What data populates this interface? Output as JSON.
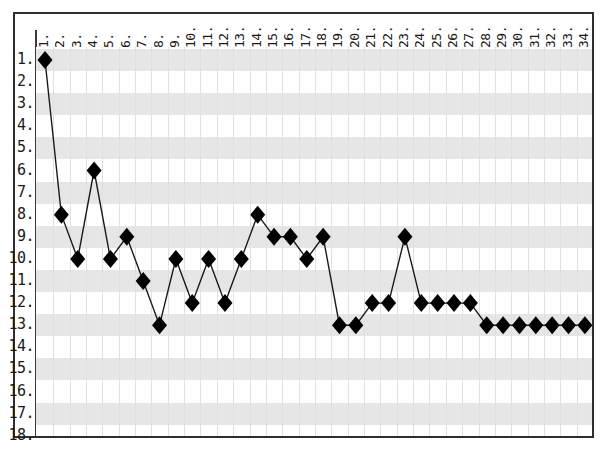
{
  "chart": {
    "type": "line",
    "background": "#ffffff",
    "band_color": "#e6e6e6",
    "grid_color": "#e0e0e0",
    "marker_color": "#000000",
    "line_color": "#1a1a1a",
    "border_color": "#2e2e2e"
  },
  "axes": {
    "x_ticks": [
      "1.",
      "2.",
      "3.",
      "4.",
      "5.",
      "6.",
      "7.",
      "8.",
      "9.",
      "10.",
      "11.",
      "12.",
      "13.",
      "14.",
      "15.",
      "16.",
      "17.",
      "18.",
      "19.",
      "20.",
      "21.",
      "22.",
      "23.",
      "24.",
      "25.",
      "26.",
      "27.",
      "28.",
      "29.",
      "30.",
      "31.",
      "32.",
      "33.",
      "34."
    ],
    "y_ticks": [
      "1.",
      "2.",
      "3.",
      "4.",
      "5.",
      "6.",
      "7.",
      "8.",
      "9.",
      "10.",
      "11.",
      "12.",
      "13.",
      "14.",
      "15.",
      "16.",
      "17.",
      "18."
    ]
  },
  "chart_data": {
    "type": "line",
    "title": "",
    "xlabel": "",
    "ylabel": "",
    "x": [
      1,
      2,
      3,
      4,
      5,
      6,
      7,
      8,
      9,
      10,
      11,
      12,
      13,
      14,
      15,
      16,
      17,
      18,
      19,
      20,
      21,
      22,
      23,
      24,
      25,
      26,
      27,
      28,
      29,
      30,
      31,
      32,
      33,
      34
    ],
    "values": [
      1,
      8,
      10,
      6,
      10,
      9,
      11,
      13,
      10,
      12,
      10,
      12,
      10,
      8,
      9,
      9,
      10,
      9,
      13,
      13,
      12,
      12,
      9,
      12,
      12,
      12,
      12,
      13,
      13,
      13,
      13,
      13,
      13,
      13
    ],
    "categories": [
      "1",
      "2",
      "3",
      "4",
      "5",
      "6",
      "7",
      "8",
      "9",
      "10",
      "11",
      "12",
      "13",
      "14",
      "15",
      "16",
      "17",
      "18",
      "19",
      "20",
      "21",
      "22",
      "23",
      "24",
      "25",
      "26",
      "27",
      "28",
      "29",
      "30",
      "31",
      "32",
      "33",
      "34"
    ],
    "xlim": [
      1,
      34
    ],
    "ylim": [
      1,
      18
    ],
    "y_axis_inverted": true,
    "grid": true,
    "legend": false,
    "marker": "diamond",
    "series": [
      {
        "name": "rank",
        "values": [
          1,
          8,
          10,
          6,
          10,
          9,
          11,
          13,
          10,
          12,
          10,
          12,
          10,
          8,
          9,
          9,
          10,
          9,
          13,
          13,
          12,
          12,
          9,
          12,
          12,
          12,
          12,
          13,
          13,
          13,
          13,
          13,
          13,
          13
        ]
      }
    ]
  }
}
